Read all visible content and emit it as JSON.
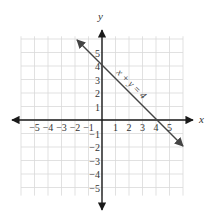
{
  "chart_data": {
    "type": "line",
    "title": "",
    "xlabel": "x",
    "ylabel": "y",
    "xlim": [
      -6,
      6
    ],
    "ylim": [
      -6,
      6
    ],
    "grid": true,
    "x_ticks": [
      "-5",
      "-4",
      "-3",
      "-2",
      "-1",
      "1",
      "2",
      "3",
      "4",
      "5"
    ],
    "y_ticks": [
      "5",
      "4",
      "3",
      "2",
      "1",
      "-1",
      "-2",
      "-3",
      "-4",
      "-5"
    ],
    "series": [
      {
        "name": "x + y = 4",
        "equation": "x + y = 4",
        "x": [
          -1.3,
          5.9
        ],
        "y": [
          5.3,
          -1.9
        ]
      }
    ],
    "annotations": [
      {
        "text": "x + y = 4",
        "position": "along line, upper right"
      }
    ]
  },
  "labels": {
    "x_axis": "x",
    "y_axis": "y",
    "equation": "x + y = 4",
    "x_ticks": [
      "−5",
      "−4",
      "−3",
      "−2",
      "−1",
      "1",
      "2",
      "3",
      "4",
      "5"
    ],
    "y_ticks_pos": [
      "5",
      "4",
      "3",
      "2",
      "1"
    ],
    "y_ticks_neg": [
      "−1",
      "−2",
      "−3",
      "−4",
      "−5"
    ]
  },
  "colors": {
    "axis": "#1a1a1a",
    "line": "#444444",
    "grid": "#d9d9d9"
  }
}
